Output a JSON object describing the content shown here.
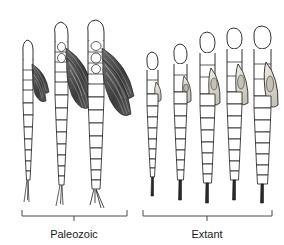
{
  "figure": {
    "type": "scientific-illustration",
    "background_color": "#ffffff",
    "ink_color": "#1a1a1a",
    "wing_fill": "#4a4a4a",
    "pad_fill": "#d8d4cc",
    "width": 284,
    "height": 245
  },
  "groups": [
    {
      "id": "paleozoic",
      "label": "Paleozoic",
      "bracket": {
        "x1": 22,
        "x2": 127,
        "y": 216,
        "tick_x": 74,
        "tick_len": 5,
        "cap_len": 6
      },
      "label_x": 74,
      "label_y": 238,
      "specimen_count": 3
    },
    {
      "id": "extant",
      "label": "Extant",
      "bracket": {
        "x1": 143,
        "x2": 272,
        "y": 216,
        "tick_x": 207,
        "tick_len": 5,
        "cap_len": 6
      },
      "label_x": 207,
      "label_y": 238,
      "specimen_count": 5
    }
  ],
  "specimens": [
    {
      "id": "p1",
      "group": "paleozoic",
      "cx": 28,
      "top": 40,
      "bottom": 202,
      "body_w": 11,
      "wings": true,
      "wing_size": "small",
      "pads": false
    },
    {
      "id": "p2",
      "group": "paleozoic",
      "cx": 61,
      "top": 22,
      "bottom": 206,
      "body_w": 13,
      "wings": true,
      "wing_size": "medium",
      "pads": false
    },
    {
      "id": "p3",
      "group": "paleozoic",
      "cx": 96,
      "top": 20,
      "bottom": 208,
      "body_w": 15,
      "wings": true,
      "wing_size": "large",
      "pads": false
    },
    {
      "id": "e1",
      "group": "extant",
      "cx": 152,
      "top": 52,
      "bottom": 196,
      "body_w": 11,
      "wings": false,
      "wing_size": "none",
      "pads": true
    },
    {
      "id": "e2",
      "group": "extant",
      "cx": 180,
      "top": 44,
      "bottom": 200,
      "body_w": 12,
      "wings": false,
      "wing_size": "none",
      "pads": true
    },
    {
      "id": "e3",
      "group": "extant",
      "cx": 207,
      "top": 32,
      "bottom": 203,
      "body_w": 14,
      "wings": false,
      "wing_size": "none",
      "pads": true
    },
    {
      "id": "e4",
      "group": "extant",
      "cx": 234,
      "top": 28,
      "bottom": 200,
      "body_w": 15,
      "wings": false,
      "wing_size": "none",
      "pads": true
    },
    {
      "id": "e5",
      "group": "extant",
      "cx": 262,
      "top": 26,
      "bottom": 203,
      "body_w": 16,
      "wings": false,
      "wing_size": "none",
      "pads": true
    }
  ]
}
